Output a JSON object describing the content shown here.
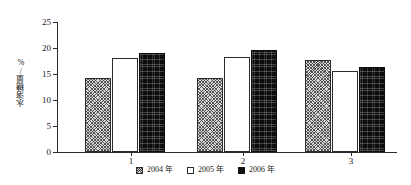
{
  "chart_data": {
    "type": "bar",
    "title": "",
    "subtitle": "",
    "xlabel": "",
    "ylabel": "水溶糖量/%",
    "categories": [
      "1",
      "2",
      "3"
    ],
    "series": [
      {
        "name": "2004 年",
        "values": [
          14.2,
          14.3,
          17.6
        ],
        "fill": "crosshatch",
        "color": "#d9d9d9"
      },
      {
        "name": "2005 年",
        "values": [
          18.0,
          18.3,
          15.6
        ],
        "fill": "solid-white",
        "color": "#ffffff"
      },
      {
        "name": "2006 年",
        "values": [
          19.1,
          19.7,
          16.3
        ],
        "fill": "solid-black",
        "color": "#0d0d0d"
      }
    ],
    "ylim": [
      0,
      25
    ],
    "yticks": [
      0,
      5,
      10,
      15,
      20,
      25
    ],
    "ytick_labels": [
      "0",
      "5",
      "10",
      "15",
      "20",
      "25"
    ],
    "xtick_labels": [
      "1",
      "2",
      "3"
    ],
    "grid": false,
    "legend_position": "bottom-center"
  },
  "axes": {
    "y": {
      "label": "水溶糖量/%",
      "ticks": [
        {
          "value": 25,
          "label": "25"
        },
        {
          "value": 20,
          "label": "20"
        },
        {
          "value": 15,
          "label": "15"
        },
        {
          "value": 10,
          "label": "10"
        },
        {
          "value": 5,
          "label": "5"
        },
        {
          "value": 0,
          "label": "0"
        }
      ]
    },
    "x": {
      "label": "",
      "ticks": [
        {
          "label": "1"
        },
        {
          "label": "2"
        },
        {
          "label": "3"
        }
      ]
    }
  },
  "legend": {
    "items": [
      {
        "label": "2004 年",
        "swatch": "crosshatch-swatch"
      },
      {
        "label": "2005 年",
        "swatch": "white-swatch"
      },
      {
        "label": "2006 年",
        "swatch": "black-swatch"
      }
    ]
  }
}
